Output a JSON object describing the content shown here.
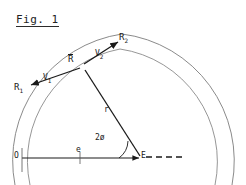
{
  "figure": {
    "title": "Fig. 1",
    "type": "geometric-vector-diagram",
    "background_color": "#ffffff",
    "ink_color": "#1a1a1a",
    "arc_color": "#777777"
  },
  "labels": {
    "title": "Fig. 1",
    "origin": "O",
    "focus": "E",
    "eccentricity": "e",
    "radius": "r",
    "angle": "2ø",
    "r_mean_base": "R",
    "r1_base": "R",
    "r1_sub": "1",
    "r2_base": "R",
    "r2_sub": "2",
    "v1_base": "V",
    "v1_sub": "1",
    "v2_base": "V",
    "v2_sub": "2"
  },
  "geometry": {
    "arc_outer": {
      "cx": 22,
      "cy": 160,
      "r": 128
    },
    "arc_inner": {
      "cx": 22,
      "cy": 160,
      "r": 114
    },
    "point_O": {
      "x": 22,
      "y": 158
    },
    "point_E": {
      "x": 141,
      "y": 158
    },
    "point_Rbar": {
      "x": 82,
      "y": 66
    },
    "point_R1": {
      "x": 27,
      "y": 86
    },
    "point_R2": {
      "x": 121,
      "y": 40
    },
    "vector_e_label_at": {
      "x": 76,
      "y": 151
    },
    "vector_r_label_at": {
      "x": 105,
      "y": 110
    },
    "angle_label_at": {
      "x": 104,
      "y": 139
    },
    "dashed_end": {
      "x": 182,
      "y": 158
    }
  }
}
